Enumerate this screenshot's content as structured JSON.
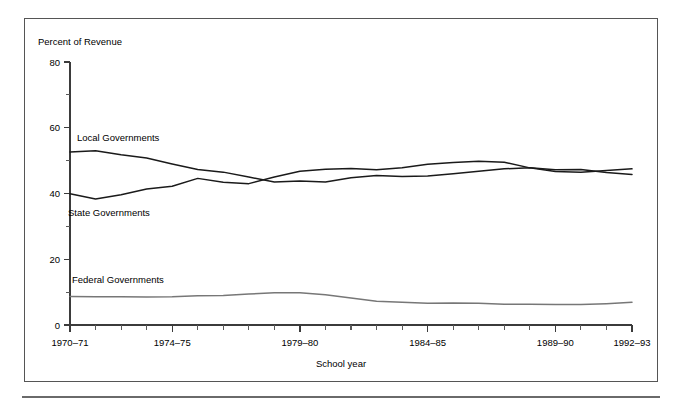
{
  "figure": {
    "unit_title": "Percent of Revenue",
    "xaxis_caption": "School year"
  },
  "chart_data": {
    "type": "line",
    "title": "",
    "subtitle": "",
    "xlabel": "School year",
    "ylabel": "Percent of Revenue",
    "ylim": [
      0,
      80
    ],
    "ytick_labels": [
      "0",
      "20",
      "40",
      "60",
      "80"
    ],
    "ytick_values": [
      0,
      20,
      40,
      60,
      80
    ],
    "yminor_values": [
      10,
      30,
      50,
      70
    ],
    "grid": false,
    "legend_position": "inline-labels",
    "x": [
      "1970-71",
      "1971-72",
      "1972-73",
      "1973-74",
      "1974-75",
      "1975-76",
      "1976-77",
      "1977-78",
      "1978-79",
      "1979-80",
      "1980-81",
      "1981-82",
      "1982-83",
      "1983-84",
      "1984-85",
      "1985-86",
      "1986-87",
      "1987-88",
      "1988-89",
      "1989-90",
      "1990-91",
      "1991-92",
      "1992-93"
    ],
    "xtick_labels": [
      "1970–71",
      "1974–75",
      "1979–80",
      "1984–85",
      "1989–90",
      "1992–93"
    ],
    "xtick_label_positions": [
      "1970-71",
      "1974-75",
      "1979-80",
      "1984-85",
      "1989-90",
      "1992-93"
    ],
    "series": [
      {
        "name": "Local Governments",
        "color": "#1a1a1a",
        "label_text": "Local Governments",
        "values": [
          52.6,
          53.0,
          51.8,
          50.8,
          49.0,
          47.3,
          46.5,
          45.0,
          43.5,
          43.8,
          43.5,
          44.8,
          45.5,
          45.2,
          45.3,
          46.0,
          46.8,
          47.5,
          47.8,
          46.7,
          46.5,
          47.0,
          47.5
        ]
      },
      {
        "name": "State Governments",
        "color": "#1a1a1a",
        "label_text": "State Governments",
        "values": [
          39.9,
          38.3,
          39.6,
          41.4,
          42.2,
          44.6,
          43.4,
          43.0,
          45.0,
          46.8,
          47.4,
          47.6,
          47.2,
          47.8,
          48.9,
          49.4,
          49.8,
          49.5,
          47.8,
          47.2,
          47.3,
          46.4,
          45.8
        ]
      },
      {
        "name": "Federal Governments",
        "color": "#777777",
        "label_text": "Federal Governments",
        "values": [
          8.7,
          8.6,
          8.6,
          8.5,
          8.6,
          8.9,
          9.0,
          9.4,
          9.8,
          9.8,
          9.2,
          8.2,
          7.2,
          6.9,
          6.6,
          6.7,
          6.6,
          6.3,
          6.3,
          6.2,
          6.2,
          6.5,
          6.9
        ]
      }
    ]
  }
}
